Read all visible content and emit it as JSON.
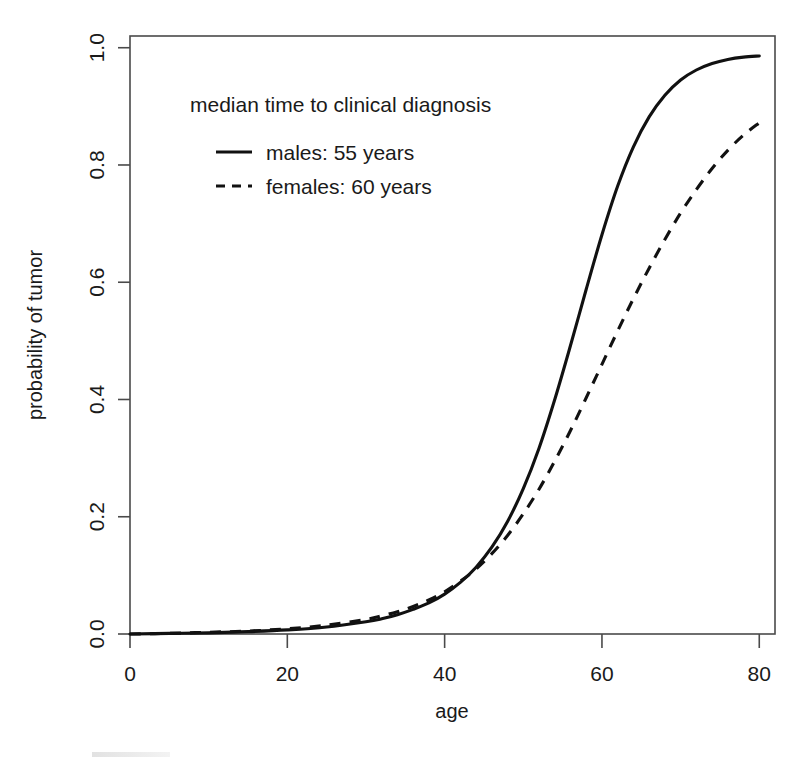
{
  "chart_data": {
    "type": "line",
    "title": "",
    "xlabel": "age",
    "ylabel": "probability of tumor",
    "xlim": [
      0,
      82
    ],
    "ylim": [
      0,
      1.02
    ],
    "grid": false,
    "legend_position": "top-left inside plot",
    "legend_title": "median time to clinical diagnosis",
    "xticks": [
      "0",
      "20",
      "40",
      "60",
      "80"
    ],
    "xtick_values": [
      0,
      20,
      40,
      60,
      80
    ],
    "yticks": [
      "0.0",
      "0.2",
      "0.4",
      "0.6",
      "0.8",
      "1.0"
    ],
    "ytick_values": [
      0.0,
      0.2,
      0.4,
      0.6,
      0.8,
      1.0
    ],
    "series": [
      {
        "name": "males: 55 years",
        "style": "solid",
        "median_years": 55,
        "x": [
          0,
          5,
          10,
          15,
          20,
          25,
          30,
          32,
          34,
          36,
          38,
          40,
          42,
          44,
          46,
          48,
          50,
          52,
          54,
          56,
          58,
          60,
          62,
          64,
          66,
          68,
          70,
          72,
          74,
          76,
          78,
          80
        ],
        "values": [
          0.0,
          0.001,
          0.002,
          0.004,
          0.007,
          0.012,
          0.021,
          0.026,
          0.033,
          0.042,
          0.053,
          0.068,
          0.088,
          0.114,
          0.148,
          0.192,
          0.248,
          0.317,
          0.4,
          0.492,
          0.588,
          0.681,
          0.764,
          0.831,
          0.882,
          0.919,
          0.945,
          0.962,
          0.973,
          0.98,
          0.984,
          0.986
        ]
      },
      {
        "name": "females: 60 years",
        "style": "dashed",
        "median_years": 60,
        "x": [
          0,
          5,
          10,
          15,
          20,
          25,
          30,
          32,
          34,
          36,
          38,
          40,
          42,
          44,
          46,
          48,
          50,
          52,
          54,
          56,
          58,
          60,
          62,
          64,
          66,
          68,
          70,
          72,
          74,
          76,
          78,
          80
        ],
        "values": [
          0.0,
          0.001,
          0.003,
          0.005,
          0.009,
          0.015,
          0.025,
          0.031,
          0.038,
          0.047,
          0.058,
          0.072,
          0.09,
          0.111,
          0.137,
          0.168,
          0.205,
          0.247,
          0.295,
          0.347,
          0.403,
          0.46,
          0.517,
          0.572,
          0.624,
          0.673,
          0.718,
          0.758,
          0.794,
          0.825,
          0.851,
          0.872
        ]
      }
    ]
  },
  "legend": {
    "title": "median time to clinical diagnosis",
    "entries": [
      {
        "label": "males: 55 years",
        "style": "solid"
      },
      {
        "label": "females: 60 years",
        "style": "dashed"
      }
    ]
  },
  "axes": {
    "x_title": "age",
    "y_title": "probability of tumor",
    "x_tick_labels": [
      "0",
      "20",
      "40",
      "60",
      "80"
    ],
    "y_tick_labels": [
      "0.0",
      "0.2",
      "0.4",
      "0.6",
      "0.8",
      "1.0"
    ]
  }
}
